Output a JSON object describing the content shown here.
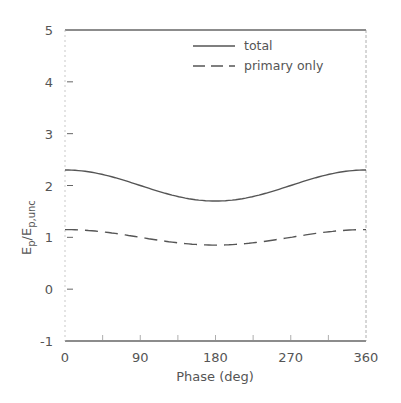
{
  "chart_data": {
    "type": "line",
    "title": "",
    "xlabel": "Phase (deg)",
    "ylabel": "E_p/E_p,unc",
    "ylabel_main": "E",
    "ylabel_sub1": "p",
    "ylabel_slash": "/E",
    "ylabel_sub2": "p,unc",
    "xlim": [
      0,
      360
    ],
    "ylim": [
      -1,
      5
    ],
    "xticks": [
      "0",
      "90",
      "180",
      "270",
      "360"
    ],
    "yticks": [
      "-1",
      "0",
      "1",
      "2",
      "3",
      "4",
      "5"
    ],
    "grid": false,
    "legend_position": "upper right",
    "x": [
      0,
      45,
      90,
      135,
      180,
      225,
      270,
      315,
      360
    ],
    "series": [
      {
        "name": "total",
        "style": "solid",
        "values": [
          2.3,
          2.21,
          2.0,
          1.79,
          1.7,
          1.79,
          2.0,
          2.21,
          2.3
        ]
      },
      {
        "name": "primary only",
        "style": "dashed",
        "values": [
          1.15,
          1.1,
          1.0,
          0.89,
          0.85,
          0.89,
          1.0,
          1.1,
          1.15
        ]
      }
    ]
  },
  "legend": {
    "items": [
      "total",
      "primary only"
    ]
  },
  "colors": {
    "line": "#555555",
    "axis": "#666666"
  }
}
